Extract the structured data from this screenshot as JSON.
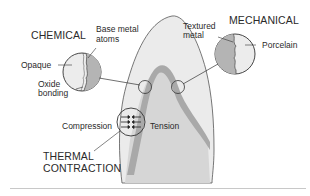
{
  "diagram": {
    "title_chemical": "CHEMICAL",
    "title_mechanical": "MECHANICAL",
    "title_thermal_line1": "THERMAL",
    "title_thermal_line2": "CONTRACTION",
    "labels": {
      "base_metal_line1": "Base metal",
      "base_metal_line2": "atoms",
      "opaque": "Opaque",
      "oxide_line1": "Oxide",
      "oxide_line2": "bonding",
      "textured_line1": "Textured",
      "textured_line2": "metal",
      "porcelain": "Porcelain",
      "compression": "Compression",
      "tension": "Tension"
    },
    "colors": {
      "porcelain_fill": "#ebebeb",
      "metal_coping": "#a9a9a9",
      "inner_core": "#d2d2d2",
      "outline": "#555555",
      "text": "#2a2a2a",
      "rule": "#c8c8c8"
    }
  }
}
